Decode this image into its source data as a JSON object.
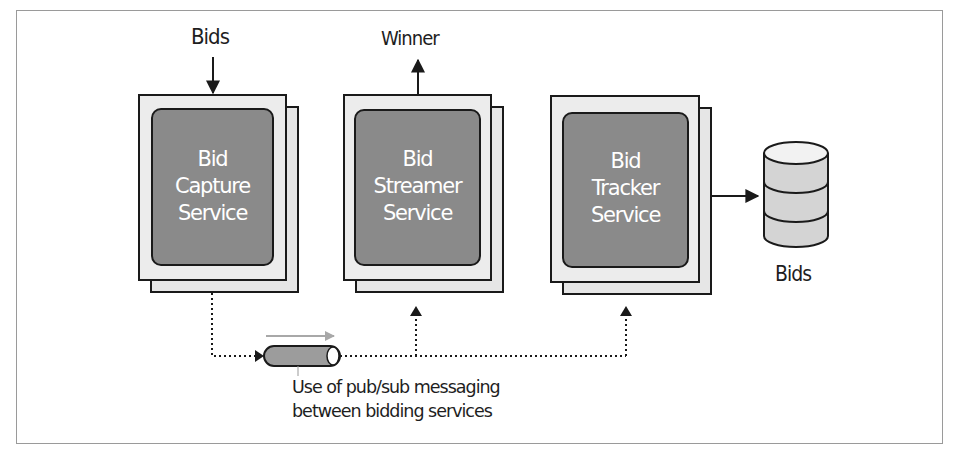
{
  "diagram": {
    "input_label": "Bids",
    "output_label": "Winner",
    "services": [
      {
        "lines": [
          "Bid",
          "Capture",
          "Service"
        ]
      },
      {
        "lines": [
          "Bid",
          "Streamer",
          "Service"
        ]
      },
      {
        "lines": [
          "Bid",
          "Tracker",
          "Service"
        ]
      }
    ],
    "database": {
      "label": "Bids"
    },
    "pubsub_caption": [
      "Use of pub/sub messaging",
      "between bidding services"
    ],
    "colors": {
      "inner_box": "#8a8a8a",
      "outer_box": "#ececec",
      "stroke": "#1a1a1a",
      "pipe_fill": "#9c9c9c",
      "db_fill": "#d4d4d4",
      "flow_arrow": "#a8a8a8"
    }
  }
}
